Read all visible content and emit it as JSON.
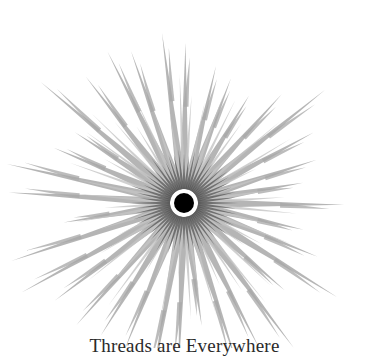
{
  "figure": {
    "caption": "Threads are Everywhere",
    "center": {
      "x": 184,
      "y": 203
    },
    "dot_radius": 10,
    "dot_color": "#000000",
    "outer_spikes": {
      "count": 36,
      "min_length": 120,
      "max_length": 188,
      "color": "#a8a8a8"
    },
    "mid_spikes": {
      "count": 48,
      "min_length": 70,
      "max_length": 130,
      "color": "#c4c4c4"
    },
    "inner_spikes": {
      "count": 60,
      "inner_radius": 14,
      "length": 42,
      "color": "#555555"
    },
    "background": "#ffffff"
  }
}
